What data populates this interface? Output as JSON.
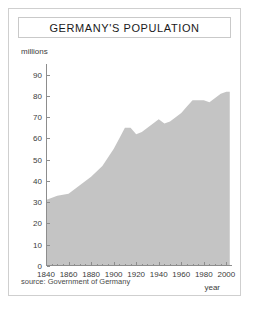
{
  "figure": {
    "title": "GERMANY'S POPULATION",
    "unit_label": "millions",
    "xaxis_title": "year",
    "source_note": "source: Government of Germany",
    "colors": {
      "area_fill": "#c4c4c4",
      "axis": "#8d8d8d",
      "border": "#cfcfcf",
      "text": "#1a1a1a"
    }
  },
  "chart_data": {
    "type": "area",
    "title": "GERMANY'S POPULATION",
    "xlabel": "year",
    "ylabel": "millions",
    "xlim": [
      1840,
      2005
    ],
    "ylim": [
      0,
      95
    ],
    "grid": false,
    "legend": false,
    "y_ticks": [
      0,
      10,
      20,
      30,
      40,
      50,
      60,
      70,
      80,
      90
    ],
    "x_ticks": [
      1840,
      1860,
      1880,
      1900,
      1920,
      1940,
      1960,
      1980,
      2000
    ],
    "x_minor_tick_step": 5,
    "series": [
      {
        "name": "Population",
        "x": [
          1840,
          1850,
          1860,
          1870,
          1880,
          1890,
          1900,
          1905,
          1910,
          1915,
          1920,
          1925,
          1930,
          1935,
          1940,
          1945,
          1950,
          1955,
          1960,
          1965,
          1970,
          1975,
          1980,
          1985,
          1990,
          1995,
          2000,
          2003
        ],
        "values": [
          31,
          33,
          34,
          38,
          42,
          47,
          55,
          60,
          65,
          65,
          62,
          63,
          65,
          67,
          69,
          67,
          68,
          70,
          72,
          75,
          78,
          78,
          78,
          77,
          79,
          81,
          82,
          82
        ]
      }
    ]
  }
}
